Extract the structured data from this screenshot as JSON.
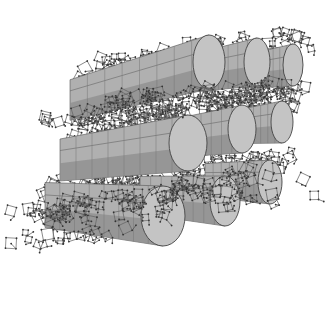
{
  "figure": {
    "colors": {
      "background": "#ffffff",
      "channel_face": "#c4c4c4",
      "channel_side_light": "#b0b0b0",
      "channel_side_dark": "#8e8e8e",
      "framework_bond": "#555555",
      "framework_atom": "#333333"
    },
    "channel_layers": [
      {
        "name": "top",
        "channels": [
          {
            "cx": 209,
            "cy": 62,
            "rx": 16,
            "ry": 27,
            "tail_x": 70,
            "tail_y": 100
          },
          {
            "cx": 257,
            "cy": 62,
            "rx": 13,
            "ry": 24,
            "tail_x": 180,
            "tail_y": 75
          },
          {
            "cx": 293,
            "cy": 65,
            "rx": 10,
            "ry": 21,
            "tail_x": 240,
            "tail_y": 72
          }
        ]
      },
      {
        "name": "middle",
        "channels": [
          {
            "cx": 188,
            "cy": 143,
            "rx": 19,
            "ry": 28,
            "tail_x": 60,
            "tail_y": 160
          },
          {
            "cx": 242,
            "cy": 129,
            "rx": 14,
            "ry": 24,
            "tail_x": 160,
            "tail_y": 140
          },
          {
            "cx": 282,
            "cy": 122,
            "rx": 11,
            "ry": 21,
            "tail_x": 225,
            "tail_y": 128
          }
        ]
      },
      {
        "name": "bottom",
        "channels": [
          {
            "cx": 163,
            "cy": 216,
            "rx": 22,
            "ry": 30,
            "tail_x": 45,
            "tail_y": 205
          },
          {
            "cx": 225,
            "cy": 201,
            "rx": 15,
            "ry": 25,
            "tail_x": 140,
            "tail_y": 195
          },
          {
            "cx": 270,
            "cy": 182,
            "rx": 12,
            "ry": 22,
            "tail_x": 205,
            "tail_y": 180
          }
        ]
      }
    ]
  }
}
